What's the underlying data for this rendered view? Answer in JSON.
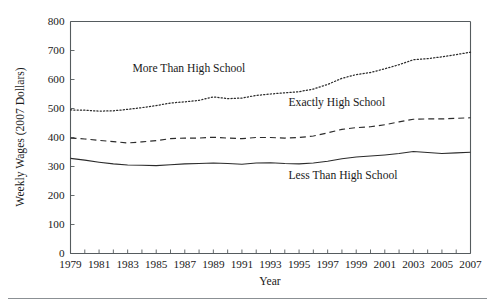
{
  "chart_data": {
    "type": "line",
    "title": "",
    "xlabel": "Year",
    "ylabel": "Weekly Wages (2007 Dollars)",
    "xlim": [
      1979,
      2007
    ],
    "ylim": [
      0,
      800
    ],
    "grid": false,
    "legend_position": "inline-annotations",
    "y_ticks": [
      0,
      100,
      200,
      300,
      400,
      500,
      600,
      700,
      800
    ],
    "y_tick_labels": [
      "0",
      "100",
      "200",
      "300",
      "400",
      "500",
      "600",
      "700",
      "800"
    ],
    "x_ticks": [
      1979,
      1980,
      1981,
      1982,
      1983,
      1984,
      1985,
      1986,
      1987,
      1988,
      1989,
      1990,
      1991,
      1992,
      1993,
      1994,
      1995,
      1996,
      1997,
      1998,
      1999,
      2000,
      2001,
      2002,
      2003,
      2004,
      2005,
      2006,
      2007
    ],
    "x_tick_labels": [
      "1979",
      "1981",
      "1983",
      "1985",
      "1987",
      "1989",
      "1991",
      "1993",
      "1995",
      "1997",
      "1999",
      "2001",
      "2003",
      "2005",
      "2007"
    ],
    "x": [
      1979,
      1980,
      1981,
      1982,
      1983,
      1984,
      1985,
      1986,
      1987,
      1988,
      1989,
      1990,
      1991,
      1992,
      1993,
      1994,
      1995,
      1996,
      1997,
      1998,
      1999,
      2000,
      2001,
      2002,
      2003,
      2004,
      2005,
      2006,
      2007
    ],
    "series": [
      {
        "name": "More Than High School",
        "style": "dotted",
        "color": "#2b2b2b",
        "values": [
          495,
          494,
          491,
          492,
          497,
          503,
          510,
          519,
          523,
          528,
          540,
          534,
          536,
          545,
          550,
          554,
          558,
          567,
          583,
          604,
          617,
          624,
          637,
          651,
          668,
          672,
          678,
          686,
          694
        ]
      },
      {
        "name": "Exactly High School",
        "style": "dashed",
        "color": "#2b2b2b",
        "values": [
          398,
          395,
          390,
          386,
          381,
          385,
          389,
          396,
          398,
          398,
          401,
          398,
          396,
          400,
          400,
          398,
          400,
          405,
          416,
          428,
          434,
          437,
          444,
          454,
          463,
          464,
          464,
          466,
          468
        ]
      },
      {
        "name": "Less Than High School",
        "style": "solid",
        "color": "#2b2b2b",
        "values": [
          328,
          322,
          315,
          309,
          305,
          304,
          303,
          306,
          309,
          310,
          312,
          310,
          308,
          312,
          313,
          310,
          309,
          312,
          318,
          327,
          333,
          336,
          340,
          345,
          352,
          348,
          345,
          347,
          349
        ]
      }
    ],
    "annotations": [
      {
        "text": "More Than High School",
        "x_frac": 0.155,
        "y_value": 625
      },
      {
        "text": "Exactly High School",
        "x_frac": 0.545,
        "y_value": 508
      },
      {
        "text": "Less Than High School",
        "x_frac": 0.545,
        "y_value": 258
      }
    ]
  }
}
